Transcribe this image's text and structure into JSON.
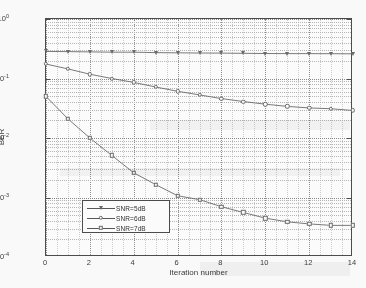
{
  "chart_data": {
    "type": "line",
    "title": "",
    "subtitle": "",
    "xlabel": "Iteration number",
    "ylabel": "BER",
    "xscale": "linear",
    "yscale": "log",
    "xlim": [
      0,
      14
    ],
    "ylim": [
      0.0001,
      1
    ],
    "xticks": [
      0,
      2,
      4,
      6,
      8,
      10,
      12,
      14
    ],
    "xticklabels": [
      "0",
      "2",
      "4",
      "6",
      "8",
      "10",
      "12",
      "14"
    ],
    "yticks": [
      1,
      0.1,
      0.01,
      0.001,
      0.0001
    ],
    "yticklabels": [
      "10^0",
      "10^-1",
      "10^-2",
      "10^-3",
      "10^-4"
    ],
    "grid": true,
    "grid_minor": true,
    "legend_position": "lower-left",
    "x": [
      0,
      1,
      2,
      3,
      4,
      5,
      6,
      7,
      8,
      9,
      10,
      11,
      12,
      13,
      14
    ],
    "series": [
      {
        "name": "SNR=5dB",
        "marker": "triangle-down",
        "values": [
          0.285,
          0.283,
          0.28,
          0.277,
          0.277,
          0.272,
          0.27,
          0.268,
          0.267,
          0.265,
          0.263,
          0.262,
          0.262,
          0.261,
          0.26
        ]
      },
      {
        "name": "SNR=6dB",
        "marker": "circle",
        "values": [
          0.175,
          0.145,
          0.118,
          0.1,
          0.086,
          0.072,
          0.061,
          0.053,
          0.046,
          0.041,
          0.037,
          0.034,
          0.032,
          0.031,
          0.029
        ]
      },
      {
        "name": "SNR=7dB",
        "marker": "square",
        "values": [
          0.05,
          0.021,
          0.01,
          0.0051,
          0.0026,
          0.00165,
          0.00107,
          0.00092,
          0.0007,
          0.00056,
          0.00045,
          0.00039,
          0.00036,
          0.00034,
          0.00034
        ]
      }
    ]
  },
  "ylabel_ticks": [
    {
      "mantissa": "10",
      "exponent": "0"
    },
    {
      "mantissa": "10",
      "exponent": "-1"
    },
    {
      "mantissa": "10",
      "exponent": "-2"
    },
    {
      "mantissa": "10",
      "exponent": "-3"
    },
    {
      "mantissa": "10",
      "exponent": "-4"
    }
  ],
  "legend": {
    "entries": [
      {
        "label": "SNR=5dB",
        "marker": "triangle-down"
      },
      {
        "label": "SNR=6dB",
        "marker": "circle"
      },
      {
        "label": "SNR=7dB",
        "marker": "square"
      }
    ]
  },
  "colors": {
    "axis": "#4a4a4a",
    "grid_major": "#8a8a8a",
    "grid_minor": "#b6b6b6",
    "series": "#6a6a6a",
    "background": "#ffffff",
    "text": "#3a3a3a"
  }
}
